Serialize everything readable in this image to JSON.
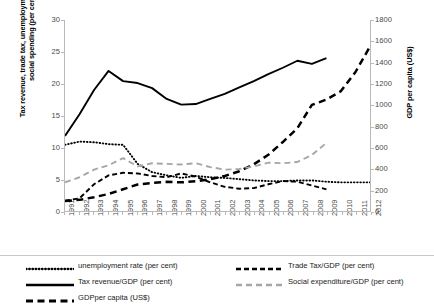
{
  "chart_data": {
    "type": "line",
    "title": "",
    "xlabel": "",
    "ylabel": "Tax revenue, trade tax, unemployment rate, and social spending (per cent)",
    "ylabel_right": "GDP per capita (US$)",
    "x": [
      1991,
      1992,
      1993,
      1994,
      1995,
      1996,
      1997,
      1998,
      1999,
      2000,
      2001,
      2002,
      2003,
      2004,
      2005,
      2006,
      2007,
      2008,
      2009,
      2010,
      2011,
      2012
    ],
    "xlim": [
      1991,
      2012
    ],
    "ylim": [
      0,
      30
    ],
    "ylim_right": [
      0,
      1800
    ],
    "yticks": [
      0,
      5,
      10,
      15,
      20,
      25,
      30
    ],
    "yticks_right": [
      0,
      200,
      400,
      600,
      800,
      1000,
      1200,
      1400,
      1600,
      1800
    ],
    "grid": false,
    "legend_position": "below",
    "series": [
      {
        "name": "unemployment rate (per cent)",
        "axis": "left",
        "style": "dotted",
        "color": "#000000",
        "x": [
          1991,
          1992,
          1993,
          1994,
          1995,
          1996,
          1997,
          1998,
          1999,
          2000,
          2001,
          2002,
          2003,
          2004,
          2005,
          2006,
          2007,
          2008,
          2009,
          2010,
          2011,
          2012
        ],
        "values": [
          10.4,
          10.9,
          10.8,
          10.5,
          10.4,
          7.4,
          6.1,
          5.6,
          5.2,
          5.5,
          5.3,
          5.2,
          5.0,
          4.8,
          4.7,
          4.7,
          4.8,
          4.8,
          4.6,
          4.5,
          4.5,
          4.5
        ]
      },
      {
        "name": "Tax revenue/GDP (per cent)",
        "axis": "left",
        "style": "solid",
        "color": "#000000",
        "x": [
          1991,
          1992,
          1993,
          1994,
          1995,
          1996,
          1997,
          1998,
          1999,
          2000,
          2001,
          2002,
          2003,
          2004,
          2005,
          2006,
          2007,
          2008,
          2009
        ],
        "values": [
          11.8,
          15.2,
          19.0,
          22.0,
          20.4,
          20.1,
          19.3,
          17.6,
          16.7,
          16.8,
          17.6,
          18.4,
          19.4,
          20.4,
          21.5,
          22.5,
          23.6,
          23.1,
          24.0
        ]
      },
      {
        "name": "GDPper capita (US$)",
        "axis": "right",
        "style": "dashed-thick",
        "color": "#000000",
        "x": [
          1991,
          1992,
          1993,
          1994,
          1995,
          1996,
          1997,
          1998,
          1999,
          2000,
          2001,
          2002,
          2003,
          2004,
          2005,
          2006,
          2007,
          2008,
          2009,
          2010,
          2011,
          2012
        ],
        "values": [
          95,
          105,
          130,
          160,
          205,
          250,
          265,
          275,
          270,
          280,
          300,
          330,
          375,
          440,
          530,
          650,
          780,
          1000,
          1050,
          1130,
          1310,
          1550
        ]
      },
      {
        "name": "Trade Tax/GDP (per cent)",
        "axis": "left",
        "style": "dashed",
        "color": "#000000",
        "x": [
          1991,
          1992,
          1993,
          1994,
          1995,
          1996,
          1997,
          1998,
          1999,
          2000,
          2001,
          2002,
          2003,
          2004,
          2005,
          2006,
          2007,
          2008,
          2009
        ],
        "values": [
          1.6,
          2.0,
          4.2,
          5.6,
          6.0,
          5.9,
          5.5,
          5.3,
          5.9,
          5.4,
          4.5,
          3.8,
          3.5,
          3.6,
          4.2,
          4.7,
          4.6,
          4.0,
          3.4
        ]
      },
      {
        "name": "Social expenditure/GDP (per cent)",
        "axis": "left",
        "style": "dashed-gray",
        "color": "#a6a6a6",
        "x": [
          1991,
          1992,
          1993,
          1994,
          1995,
          1996,
          1997,
          1998,
          1999,
          2000,
          2001,
          2002,
          2003,
          2004,
          2005,
          2006,
          2007,
          2008,
          2009
        ],
        "values": [
          4.5,
          5.3,
          6.5,
          7.2,
          8.3,
          7.0,
          7.5,
          7.4,
          7.3,
          7.5,
          6.9,
          6.5,
          6.6,
          7.0,
          7.6,
          7.5,
          7.7,
          8.8,
          10.7
        ]
      }
    ],
    "legend": [
      {
        "label": "unemployment rate (per cent)",
        "style": "dotted",
        "color": "#000000"
      },
      {
        "label": "Trade Tax/GDP (per cent)",
        "style": "dashed",
        "color": "#000000"
      },
      {
        "label": "Tax revenue/GDP (per cent)",
        "style": "solid",
        "color": "#000000"
      },
      {
        "label": "Social expenditure/GDP (per cent)",
        "style": "dashed-gray",
        "color": "#a6a6a6"
      },
      {
        "label": "GDPper capita (US$)",
        "style": "dashed-thick",
        "color": "#000000"
      }
    ]
  }
}
